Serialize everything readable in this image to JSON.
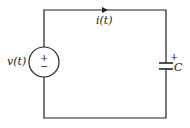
{
  "diagram": {
    "type": "circuit",
    "source": {
      "label": "v(t)",
      "polarity_plus": "+",
      "polarity_minus": "−"
    },
    "current": {
      "label": "i(t)"
    },
    "capacitor": {
      "label": "C",
      "polarity_plus": "+"
    },
    "colors": {
      "line": "#222222",
      "background": "#ffffff"
    }
  }
}
